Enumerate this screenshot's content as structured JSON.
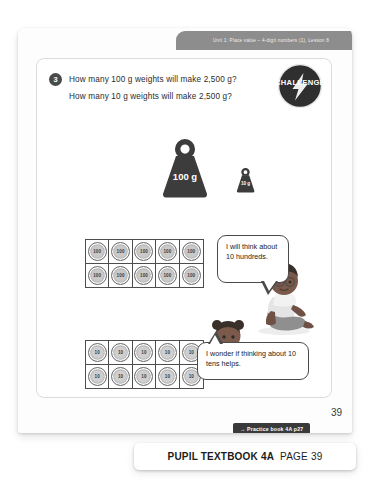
{
  "page": {
    "running_head": "Unit 1: Place value – 4-digit numbers (1), Lesson 8",
    "folio": "39"
  },
  "question": {
    "number": "3",
    "line_1": "How many 100 g weights will make 2,500 g?",
    "line_2": "How many 10 g weights will make 2,500 g?"
  },
  "challenge": {
    "label": "CHALLENGE"
  },
  "weights": [
    {
      "name": "weight-100g",
      "label": "100 g"
    },
    {
      "name": "weight-10g",
      "label": "10 g"
    }
  ],
  "ten_frames": [
    {
      "name": "hundreds-ten-frame",
      "counter_value": "100",
      "rows": 2,
      "columns": 5,
      "count": 10
    },
    {
      "name": "tens-ten-frame",
      "counter_value": "10",
      "rows": 2,
      "columns": 5,
      "count": 10
    }
  ],
  "speech_bubbles": [
    {
      "name": "speech-bubble-hundreds",
      "text": "I will think about 10 hundreds."
    },
    {
      "name": "speech-bubble-tens",
      "text": "I wonder if thinking about 10 tens helps."
    }
  ],
  "practice_link": {
    "arrow": "→",
    "label": "Practice book 4A p27"
  },
  "bottom_banner": {
    "title": "PUPIL TEXTBOOK 4A",
    "page_label": "PAGE 39"
  },
  "colors": {
    "running_head_bg": "#8d8d8d",
    "badge_dark": "#2f2f2f",
    "counter_fill": "#c9c9c9",
    "tag_bg": "#3a3a3a",
    "weight_fill": "#3c3c3c"
  }
}
